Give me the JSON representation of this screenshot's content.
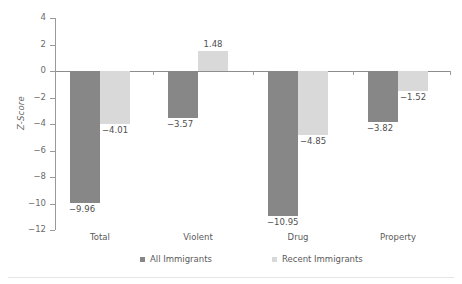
{
  "chart_data": {
    "type": "bar",
    "title": "",
    "xlabel": "",
    "ylabel": "Z-Score",
    "ylim": [
      -12,
      4
    ],
    "yticks": [
      4,
      2,
      0,
      -2,
      -4,
      -6,
      -8,
      -10,
      -12
    ],
    "ytick_labels": [
      "4",
      "2",
      "0",
      "−2",
      "−4",
      "−6",
      "−8",
      "−10",
      "−12"
    ],
    "grid": false,
    "legend_position": "bottom",
    "categories": [
      "Total",
      "Violent",
      "Drug",
      "Property"
    ],
    "series": [
      {
        "name": "All Immigrants",
        "color": "#878787",
        "values": [
          -9.96,
          -3.57,
          -10.95,
          -3.82
        ],
        "labels": [
          "−9.96",
          "−3.57",
          "−10.95",
          "−3.82"
        ]
      },
      {
        "name": "Recent Immigrants",
        "color": "#d9d9d9",
        "values": [
          -4.01,
          1.48,
          -4.85,
          -1.52
        ],
        "labels": [
          "−4.01",
          "1.48",
          "−4.85",
          "−1.52"
        ]
      }
    ]
  },
  "legend": {
    "items": [
      {
        "label": "All Immigrants",
        "color": "#878787"
      },
      {
        "label": "Recent Immigrants",
        "color": "#d9d9d9"
      }
    ]
  }
}
